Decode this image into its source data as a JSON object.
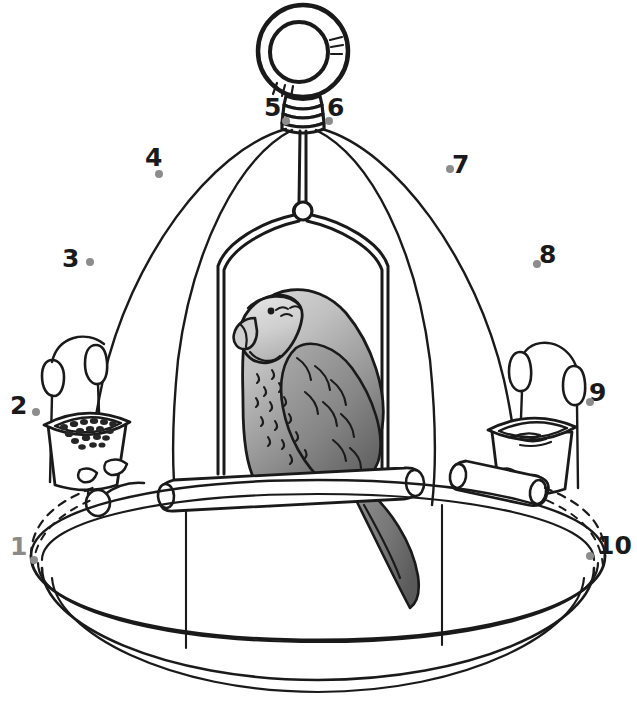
{
  "figure": {
    "background_color": "#ffffff",
    "line_color": "#1a1a1a",
    "dot_color": "#8d8d8d"
  },
  "callouts": [
    {
      "id": "1",
      "label": "1",
      "target": "cage-base-tray",
      "label_color": "#8a8a8a",
      "label_x": 10,
      "label_y": 534,
      "dot_x": 30,
      "dot_y": 556
    },
    {
      "id": "2",
      "label": "2",
      "target": "seed-cup",
      "label_color": "#1a1a1a",
      "label_x": 10,
      "label_y": 393,
      "dot_x": 32,
      "dot_y": 408
    },
    {
      "id": "3",
      "label": "3",
      "target": "cage-bar-left-outer",
      "label_color": "#1a1a1a",
      "label_x": 62,
      "label_y": 246,
      "dot_x": 86,
      "dot_y": 258
    },
    {
      "id": "4",
      "label": "4",
      "target": "cage-bar-left-inner",
      "label_color": "#1a1a1a",
      "label_x": 145,
      "label_y": 145,
      "dot_x": 155,
      "dot_y": 170
    },
    {
      "id": "5",
      "label": "5",
      "target": "hanging-collar-left",
      "label_color": "#1a1a1a",
      "label_x": 264,
      "label_y": 95,
      "dot_x": 282,
      "dot_y": 117
    },
    {
      "id": "6",
      "label": "6",
      "target": "hanging-collar-right",
      "label_color": "#1a1a1a",
      "label_x": 327,
      "label_y": 95,
      "dot_x": 325,
      "dot_y": 117
    },
    {
      "id": "7",
      "label": "7",
      "target": "cage-bar-right-inner",
      "label_color": "#1a1a1a",
      "label_x": 452,
      "label_y": 152,
      "dot_x": 446,
      "dot_y": 165
    },
    {
      "id": "8",
      "label": "8",
      "target": "cage-bar-right-outer",
      "label_color": "#1a1a1a",
      "label_x": 539,
      "label_y": 242,
      "dot_x": 533,
      "dot_y": 260
    },
    {
      "id": "9",
      "label": "9",
      "target": "water-cup",
      "label_color": "#1a1a1a",
      "label_x": 589,
      "label_y": 380,
      "dot_x": 586,
      "dot_y": 398
    },
    {
      "id": "10",
      "label": "10",
      "target": "cage-base-rim",
      "label_color": "#1a1a1a",
      "label_x": 597,
      "label_y": 533,
      "dot_x": 586,
      "dot_y": 552
    }
  ],
  "parts": {
    "hanging_ring": "hanging-ring",
    "hanging_collar": "hanging-collar",
    "dome_bars": "cage-dome-bars",
    "swing": "swing-perch",
    "swing_hook": "swing-hook",
    "bird": "grey-parrot",
    "perch_upper": "wooden-perch-upper",
    "perch_lower": "wooden-perch-lower",
    "seed_cup": "seed-cup",
    "water_cup": "water-cup",
    "base_tray": "cage-base-tray"
  },
  "colors": {
    "outline": "#1a1a1a",
    "bird_head": "#d8d8d8",
    "bird_body_light": "#c9c9c9",
    "bird_body_dark": "#6e6e6e",
    "bird_tail": "#707070",
    "seeds": "#2a2a2a",
    "dot": "#8d8d8d"
  }
}
